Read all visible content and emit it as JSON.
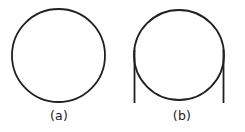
{
  "figure": {
    "background_color": "#ffffff",
    "stroke_color": "#231f20",
    "panels": [
      {
        "id": "panel-a",
        "label": "(a)",
        "shape": "circle",
        "description": "plain circle outline",
        "circle": {
          "cx": 58.5,
          "cy": 55.5,
          "r": 46.5,
          "stroke_width": 1.8
        },
        "vertical_lines": []
      },
      {
        "id": "panel-b",
        "label": "(b)",
        "shape": "circle-with-tangent-lines",
        "description": "circle outline with two vertical tangent lines extending below the circle",
        "circle": {
          "cx": 179.0,
          "cy": 55.0,
          "r": 45.0,
          "stroke_width": 1.8
        },
        "vertical_lines": [
          {
            "x": 134.5,
            "y1": 50.0,
            "y2": 103.0,
            "stroke_width": 1.8
          },
          {
            "x": 223.5,
            "y1": 50.0,
            "y2": 103.0,
            "stroke_width": 1.8
          }
        ]
      }
    ]
  }
}
